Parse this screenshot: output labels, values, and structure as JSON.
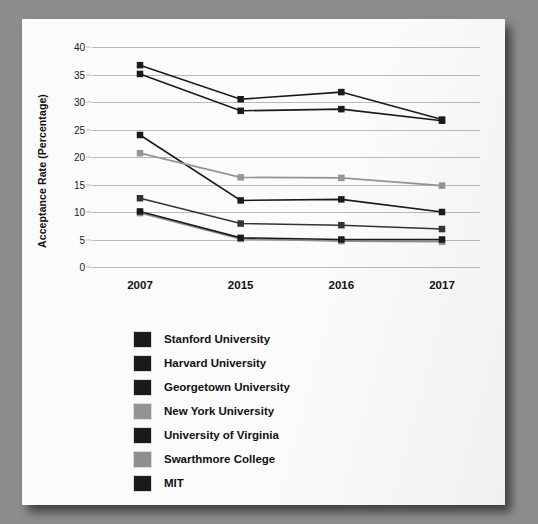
{
  "chart_data": {
    "type": "line",
    "title": "",
    "xlabel": "",
    "ylabel": "Acceptance Rate (Percentage)",
    "categories": [
      "2007",
      "2015",
      "2016",
      "2017"
    ],
    "ylim": [
      0,
      40
    ],
    "yticks": [
      0,
      5,
      10,
      15,
      20,
      25,
      30,
      35,
      40
    ],
    "grid": true,
    "legend_position": "below",
    "series": [
      {
        "name": "Stanford University",
        "values": [
          36.7,
          30.5,
          31.8,
          26.8
        ],
        "color": "#1a1a1a"
      },
      {
        "name": "Harvard University",
        "values": [
          35.1,
          28.4,
          28.7,
          26.6
        ],
        "color": "#1a1a1a"
      },
      {
        "name": "Georgetown University",
        "values": [
          24.0,
          12.1,
          12.3,
          10.0
        ],
        "color": "#1a1a1a"
      },
      {
        "name": "New York University",
        "values": [
          20.7,
          16.3,
          16.2,
          14.8
        ],
        "color": "#949494"
      },
      {
        "name": "University of Virginia",
        "values": [
          12.5,
          7.9,
          7.6,
          6.9
        ],
        "color": "#333333"
      },
      {
        "name": "Swarthmore College",
        "values": [
          9.8,
          5.1,
          4.7,
          4.6
        ],
        "color": "#8f8f8f"
      },
      {
        "name": "MIT",
        "values": [
          10.1,
          5.3,
          5.0,
          5.0
        ],
        "color": "#1a1a1a"
      }
    ]
  },
  "legend": {
    "items": [
      {
        "label": "Stanford University",
        "color": "#1a1a1a"
      },
      {
        "label": "Harvard University",
        "color": "#1a1a1a"
      },
      {
        "label": "Georgetown University",
        "color": "#1a1a1a"
      },
      {
        "label": "New York University",
        "color": "#949494"
      },
      {
        "label": "University of Virginia",
        "color": "#1a1a1a"
      },
      {
        "label": "Swarthmore College",
        "color": "#8f8f8f"
      },
      {
        "label": "MIT",
        "color": "#1a1a1a"
      }
    ]
  },
  "colors": {
    "page_background": "#8d8d8d",
    "card_background": "#fbfbfb",
    "gridline": "#b9b9b9",
    "text": "#111111"
  }
}
